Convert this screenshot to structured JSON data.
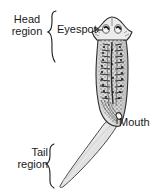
{
  "figure": {
    "organism": "planarian",
    "background_color": "#ffffff",
    "ink_color": "#1a1a1a"
  },
  "labels": {
    "head_region_line1": "Head",
    "head_region_line2": "region",
    "tail_region_line1": "Tail",
    "tail_region_line2": "region",
    "eyespot": "Eyespot",
    "mouth": "Mouth"
  },
  "annotations": [
    {
      "name": "head-region-brace",
      "label": "Head region",
      "type": "curly-brace",
      "orientation": "right-facing",
      "spans_y": [
        10,
        63
      ]
    },
    {
      "name": "tail-region-brace",
      "label": "Tail region",
      "type": "curly-brace",
      "orientation": "right-facing",
      "spans_y": [
        143,
        188
      ]
    },
    {
      "name": "eyespot-leader",
      "label": "Eyespot",
      "type": "leader-line",
      "points_to": "head eyespots"
    },
    {
      "name": "mouth-leader",
      "label": "Mouth",
      "type": "pointer",
      "points_to": "ventral mouth opening"
    }
  ],
  "anatomy": {
    "head": {
      "shape": "arrowhead-pentagon",
      "features": [
        "eyespot-left",
        "eyespot-right",
        "auricle-left",
        "auricle-right"
      ]
    },
    "body": {
      "shape": "elongated-tapered",
      "fill": "#dedede",
      "internal_structures": [
        "branched-gut",
        "pharynx",
        "nerve-cords"
      ]
    },
    "tail": {
      "shape": "tapered-lanceolate",
      "fill": "#efefef",
      "shading": "smooth-gradient"
    }
  }
}
